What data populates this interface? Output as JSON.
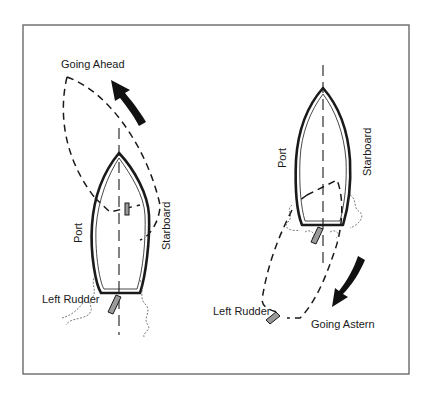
{
  "diagram": {
    "frame": {
      "x": 23,
      "y": 25,
      "width": 386,
      "height": 349
    },
    "left_panel": {
      "title": "Going Ahead",
      "port_label": "Port",
      "starboard_label": "Starboard",
      "rudder_label": "Left Rudder",
      "motion": "bow swings to port"
    },
    "right_panel": {
      "title": "Going Astern",
      "port_label": "Port",
      "starboard_label": "Starboard",
      "rudder_label": "Left Rudder",
      "motion": "stern swings to port"
    },
    "colors": {
      "line": "#1a1a1a",
      "frame": "#6a6a6a",
      "rudder": "#9a9a9a",
      "background": "#ffffff"
    }
  }
}
